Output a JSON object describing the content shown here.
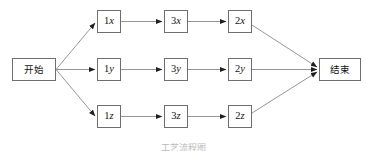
{
  "diagram": {
    "type": "flowchart",
    "title_caption": "工艺流程图",
    "colors": {
      "background": "#ffffff",
      "node_border": "#6e6e6e",
      "node_fill": "#ffffff",
      "edge_line": "#8a8a8a",
      "arrowhead": "#1f1f1f",
      "text": "#141414",
      "caption_text": "#b9b9b9"
    },
    "start_node": {
      "id": "start",
      "label": "开始",
      "x": 12,
      "y": 58,
      "w": 44,
      "h": 23
    },
    "end_node": {
      "id": "end",
      "label": "结束",
      "x": 319,
      "y": 58,
      "w": 42,
      "h": 23
    },
    "branches": [
      {
        "name": "branch-x",
        "row": 0,
        "row_y": 10,
        "steps": [
          {
            "id": "1x",
            "digit": "1",
            "var": "x",
            "x": 97,
            "y": 10,
            "w": 24,
            "h": 23
          },
          {
            "id": "3x",
            "digit": "3",
            "var": "x",
            "x": 164,
            "y": 10,
            "w": 24,
            "h": 23
          },
          {
            "id": "2x",
            "digit": "2",
            "var": "x",
            "x": 228,
            "y": 10,
            "w": 24,
            "h": 23
          }
        ]
      },
      {
        "name": "branch-y",
        "row": 1,
        "row_y": 58,
        "steps": [
          {
            "id": "1y",
            "digit": "1",
            "var": "y",
            "x": 97,
            "y": 58,
            "w": 24,
            "h": 23
          },
          {
            "id": "3y",
            "digit": "3",
            "var": "y",
            "x": 164,
            "y": 58,
            "w": 24,
            "h": 23
          },
          {
            "id": "2y",
            "digit": "2",
            "var": "y",
            "x": 228,
            "y": 58,
            "w": 24,
            "h": 23
          }
        ]
      },
      {
        "name": "branch-z",
        "row": 2,
        "row_y": 105,
        "steps": [
          {
            "id": "1z",
            "digit": "1",
            "var": "z",
            "x": 97,
            "y": 105,
            "w": 24,
            "h": 23
          },
          {
            "id": "3z",
            "digit": "3",
            "var": "z",
            "x": 164,
            "y": 105,
            "w": 24,
            "h": 23
          },
          {
            "id": "2z",
            "digit": "2",
            "var": "z",
            "x": 228,
            "y": 105,
            "w": 24,
            "h": 23
          }
        ]
      }
    ],
    "edges": [
      {
        "from": "start",
        "to": "1x"
      },
      {
        "from": "start",
        "to": "1y"
      },
      {
        "from": "start",
        "to": "1z"
      },
      {
        "from": "1x",
        "to": "3x"
      },
      {
        "from": "3x",
        "to": "2x"
      },
      {
        "from": "1y",
        "to": "3y"
      },
      {
        "from": "3y",
        "to": "2y"
      },
      {
        "from": "1z",
        "to": "3z"
      },
      {
        "from": "3z",
        "to": "2z"
      },
      {
        "from": "2x",
        "to": "end"
      },
      {
        "from": "2y",
        "to": "end"
      },
      {
        "from": "2z",
        "to": "end"
      }
    ]
  }
}
